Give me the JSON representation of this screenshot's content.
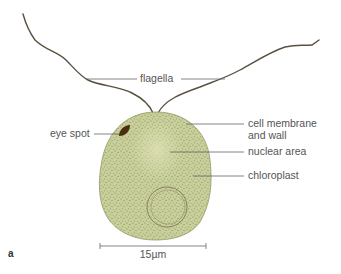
{
  "figure": {
    "panel_label": "a",
    "labels": {
      "flagella": "flagella",
      "cell_membrane_line1": "cell membrane",
      "cell_membrane_line2": "and wall",
      "nuclear_area": "nuclear area",
      "chloroplast": "chloroplast",
      "eye_spot": "eye spot"
    },
    "scale_bar": {
      "label": "15µm"
    },
    "colors": {
      "cell_fill": "#c9cf9a",
      "cell_speckle": "#7d8a55",
      "eye_spot": "#4a2e10",
      "flagella": "#5a5040",
      "text": "#555555"
    }
  }
}
